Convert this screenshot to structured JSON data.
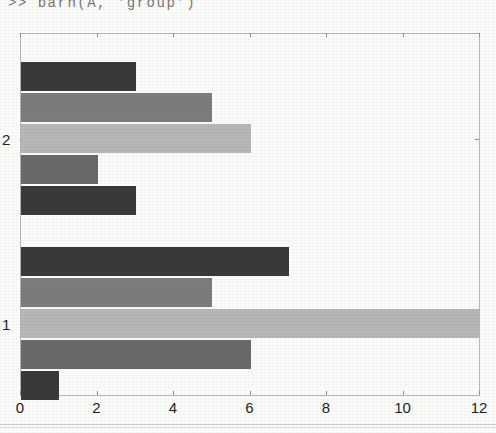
{
  "console": {
    "prompt_line": ">> barh(A, 'group')"
  },
  "chart_data": {
    "type": "bar",
    "orientation": "horizontal",
    "title": "",
    "xlabel": "",
    "ylabel": "",
    "xlim": [
      0,
      12
    ],
    "ylim": [
      0,
      3
    ],
    "xticks": [
      0,
      2,
      4,
      6,
      8,
      10,
      12
    ],
    "xtick_labels": [
      "0",
      "2",
      "4",
      "6",
      "8",
      "10",
      "12"
    ],
    "categories": [
      "1",
      "2"
    ],
    "ytick_labels": [
      "1",
      "2"
    ],
    "grid": false,
    "legend": "none",
    "bar_group_mode": "group",
    "series": [
      {
        "name": "series-1",
        "color": "#3a3a3a",
        "values": [
          7,
          3
        ]
      },
      {
        "name": "series-2",
        "color": "#7d7d7d",
        "values": [
          5,
          5
        ]
      },
      {
        "name": "series-3",
        "color": "#b8b8b8",
        "values": [
          12,
          6
        ]
      },
      {
        "name": "series-4",
        "color": "#6a6a6a",
        "values": [
          6,
          2
        ]
      },
      {
        "name": "series-5",
        "color": "#3a3a3a",
        "values": [
          1,
          3
        ]
      }
    ],
    "matrix": [
      [
        7,
        5,
        12,
        6,
        1
      ],
      [
        3,
        5,
        6,
        2,
        3
      ]
    ]
  },
  "axes": {
    "frame_color": "#b9b9b9",
    "tick_color": "#8e8e8e",
    "label_color": "#1f1f1f"
  }
}
